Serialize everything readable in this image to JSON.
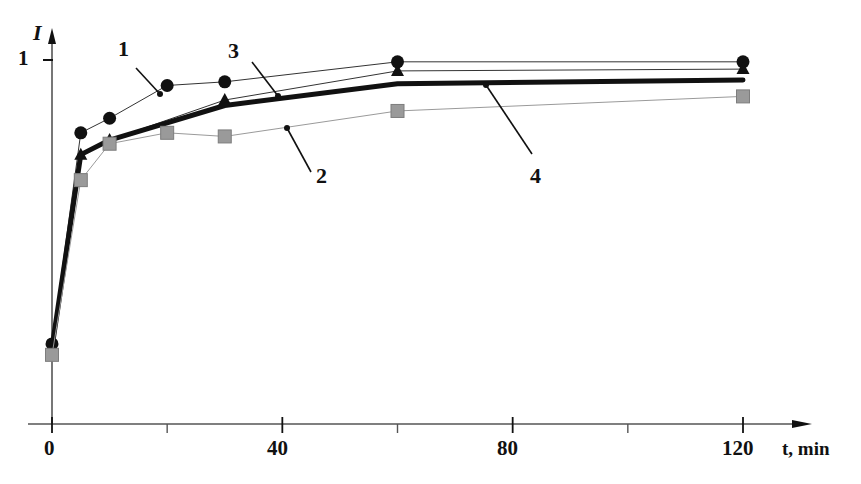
{
  "figure": {
    "background_color": "#ffffff",
    "ink_color": "#111111"
  },
  "axes": {
    "y_title": "I",
    "y_tick_labels": [
      "1"
    ],
    "x_title": "t, min",
    "x_tick_labels": [
      "0",
      "40",
      "80",
      "120"
    ]
  },
  "curve_labels": [
    {
      "text": "1"
    },
    {
      "text": "3"
    },
    {
      "text": "2"
    },
    {
      "text": "4"
    }
  ],
  "chart_data": {
    "type": "line",
    "title": "",
    "xlabel": "t, min",
    "ylabel": "I",
    "xlim": [
      0,
      124
    ],
    "ylim": [
      0,
      1.12
    ],
    "xticks": [
      0,
      40,
      80,
      120
    ],
    "xticks_minor": [
      20,
      60,
      100
    ],
    "yticks": [
      1
    ],
    "grid": false,
    "legend": "inline-curve-labels",
    "series": [
      {
        "name": "1",
        "marker": "filled-circle",
        "marker_color": "#111111",
        "line_color": "#333333",
        "line_width": 1,
        "x": [
          0,
          5,
          10,
          20,
          30,
          60,
          120
        ],
        "y": [
          0.22,
          0.8,
          0.84,
          0.93,
          0.94,
          0.995,
          0.995
        ]
      },
      {
        "name": "3",
        "marker": "filled-triangle",
        "marker_color": "#111111",
        "line_color": "#333333",
        "line_width": 1,
        "x": [
          0,
          5,
          10,
          30,
          60,
          120
        ],
        "y": [
          0.2,
          0.74,
          0.78,
          0.89,
          0.97,
          0.975
        ]
      },
      {
        "name": "4",
        "marker": "none",
        "marker_color": "#111111",
        "line_color": "#111111",
        "line_width": 5,
        "x": [
          0,
          5,
          10,
          30,
          60,
          120
        ],
        "y": [
          0.21,
          0.74,
          0.78,
          0.875,
          0.935,
          0.945
        ]
      },
      {
        "name": "2",
        "marker": "filled-square",
        "marker_color": "#9a9a9a",
        "line_color": "#9a9a9a",
        "line_width": 1,
        "x": [
          0,
          5,
          10,
          20,
          30,
          60,
          120
        ],
        "y": [
          0.19,
          0.67,
          0.77,
          0.8,
          0.79,
          0.86,
          0.9
        ]
      }
    ]
  }
}
